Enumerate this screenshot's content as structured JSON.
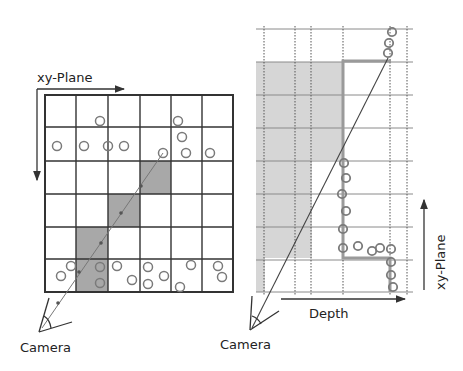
{
  "left_panel": {
    "axis_label": "xy-Plane",
    "camera_label": "Camera",
    "grid": {
      "cols": 6,
      "rows": 6
    },
    "shaded_cells": [
      [
        2,
        3
      ],
      [
        3,
        2
      ],
      [
        4,
        1
      ],
      [
        5,
        1
      ]
    ]
  },
  "right_panel": {
    "axis_vertical_label": "xy-Plane",
    "axis_horizontal_label": "Depth",
    "camera_label": "Camera"
  },
  "colors": {
    "line": "#333333",
    "grid_light": "#8a8a8a",
    "shade": "#aaaaaa",
    "shade_light": "#d4d4d4",
    "outline": "#9a9a9a",
    "circle": "#7a7a7a"
  }
}
